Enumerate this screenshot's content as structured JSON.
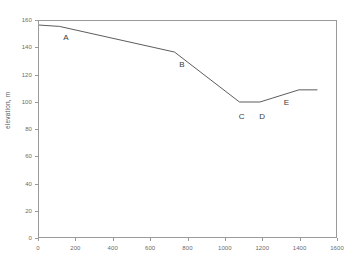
{
  "chart_data": {
    "type": "line",
    "title": "",
    "xlabel": "",
    "ylabel": "elevation, m",
    "xlim": [
      0,
      1600
    ],
    "ylim": [
      0,
      160
    ],
    "grid": false,
    "legend": null,
    "xticks": [
      0,
      200,
      400,
      600,
      800,
      1000,
      1200,
      1400,
      1600
    ],
    "yticks": [
      0,
      20,
      40,
      60,
      80,
      100,
      120,
      140,
      160
    ],
    "series": [
      {
        "name": "elevation profile",
        "color": "#4a4a4a",
        "x": [
          0,
          110,
          730,
          1080,
          1190,
          1400,
          1500
        ],
        "y": [
          157,
          156,
          137,
          100,
          100,
          109,
          109
        ]
      }
    ],
    "annotations": [
      {
        "label": "A",
        "x": 110,
        "y": 156,
        "label_x": 150,
        "label_y": 147
      },
      {
        "label": "B",
        "x": 730,
        "y": 137,
        "label_x": 770,
        "label_y": 127
      },
      {
        "label": "C",
        "x": 1080,
        "y": 100,
        "label_x": 1090,
        "label_y": 89
      },
      {
        "label": "D",
        "x": 1190,
        "y": 100,
        "label_x": 1200,
        "label_y": 89
      },
      {
        "label": "E",
        "x": 1400,
        "y": 109,
        "label_x": 1330,
        "label_y": 99
      }
    ]
  }
}
